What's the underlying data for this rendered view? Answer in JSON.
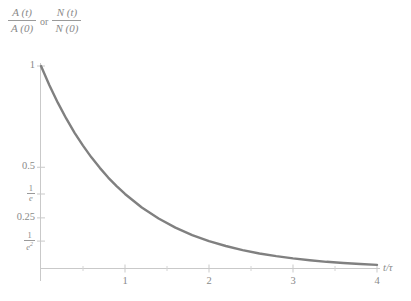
{
  "chart_data": {
    "type": "line",
    "title": "",
    "ylabel_parts": {
      "frac1_num": "A (t)",
      "frac1_den": "A (0)",
      "conjunction": "or",
      "frac2_num": "N (t)",
      "frac2_den": "N (0)"
    },
    "xlabel": "t/τ",
    "x": [
      0,
      0.1,
      0.2,
      0.3,
      0.4,
      0.5,
      0.6,
      0.7,
      0.8,
      0.9,
      1.0,
      1.2,
      1.4,
      1.6,
      1.8,
      2.0,
      2.2,
      2.4,
      2.6,
      2.8,
      3.0,
      3.2,
      3.4,
      3.6,
      3.8,
      4.0
    ],
    "y": [
      1.0,
      0.905,
      0.819,
      0.741,
      0.67,
      0.607,
      0.549,
      0.497,
      0.449,
      0.407,
      0.368,
      0.301,
      0.247,
      0.202,
      0.165,
      0.135,
      0.111,
      0.091,
      0.074,
      0.061,
      0.05,
      0.041,
      0.033,
      0.027,
      0.022,
      0.018
    ],
    "function": "exp(-t/tau)",
    "xlim": [
      0,
      4
    ],
    "ylim": [
      0,
      1
    ],
    "grid": false,
    "legend": "none",
    "xticks": [
      {
        "value": 1,
        "label": "1"
      },
      {
        "value": 2,
        "label": "2"
      },
      {
        "value": 3,
        "label": "3"
      },
      {
        "value": 4,
        "label": "4"
      }
    ],
    "xminorticks": [
      0.5,
      1.5,
      2.5,
      3.5
    ],
    "yticks": [
      {
        "value": 1.0,
        "label": "1",
        "type": "plain"
      },
      {
        "value": 0.5,
        "label": "0.5",
        "type": "plain"
      },
      {
        "value": 0.3679,
        "label": "1/e",
        "type": "frac",
        "num": "1",
        "den": "e",
        "exp": ""
      },
      {
        "value": 0.25,
        "label": "0.25",
        "type": "plain"
      },
      {
        "value": 0.1353,
        "label": "1/e²",
        "type": "frac",
        "num": "1",
        "den": "e",
        "exp": "2"
      }
    ],
    "colors": {
      "curve": "#808080",
      "axis": "#c8c8c8",
      "text": "#8a8a8a",
      "background": "#ffffff"
    }
  }
}
